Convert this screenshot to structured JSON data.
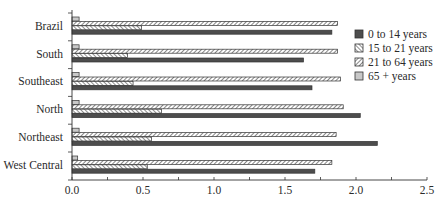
{
  "chart_data": {
    "type": "bar",
    "orientation": "horizontal",
    "title": "",
    "xlabel": "",
    "ylabel": "",
    "categories": [
      "Brazil",
      "South",
      "Southeast",
      "North",
      "Northeast",
      "West Central"
    ],
    "series": [
      {
        "name": "0 to 14 years",
        "pattern": "solid-dark",
        "values": [
          1.83,
          1.63,
          1.69,
          2.03,
          2.15,
          1.71
        ]
      },
      {
        "name": "15 to 21 years",
        "pattern": "cross-hatch",
        "values": [
          0.49,
          0.39,
          0.43,
          0.63,
          0.56,
          0.53
        ]
      },
      {
        "name": "21 to 64 years",
        "pattern": "diagonal-hatch",
        "values": [
          1.87,
          1.87,
          1.89,
          1.91,
          1.86,
          1.83
        ]
      },
      {
        "name": "65 + years",
        "pattern": "solid-light",
        "values": [
          0.05,
          0.05,
          0.05,
          0.05,
          0.05,
          0.04
        ]
      }
    ],
    "xlim": [
      0,
      2.5
    ],
    "xticks": [
      "0.0",
      "0.5",
      "1.0",
      "1.5",
      "2.0",
      "2.5"
    ],
    "grid": false,
    "legend_position": "right"
  },
  "legend": {
    "items": [
      "0 to 14 years",
      "15 to 21 years",
      "21 to 64 years",
      "65 + years"
    ]
  }
}
